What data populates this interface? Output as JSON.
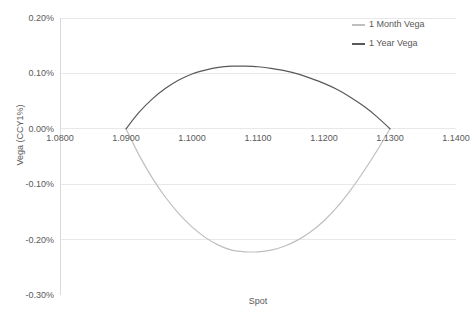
{
  "chart_data": {
    "type": "line",
    "title": "",
    "xlabel": "Spot",
    "ylabel": "Vega (CCY1%)",
    "xlim": [
      1.08,
      1.14
    ],
    "ylim": [
      -0.003,
      0.002
    ],
    "xtick_labels": [
      "1.0800",
      "1.0900",
      "1.1000",
      "1.1100",
      "1.1200",
      "1.1300",
      "1.1400"
    ],
    "xtick_values": [
      1.08,
      1.09,
      1.1,
      1.11,
      1.12,
      1.13,
      1.14
    ],
    "ytick_labels": [
      "0.20%",
      "0.10%",
      "0.00%",
      "-0.10%",
      "-0.20%",
      "-0.30%"
    ],
    "ytick_values": [
      0.002,
      0.001,
      0.0,
      -0.001,
      -0.002,
      -0.003
    ],
    "grid": "horizontal",
    "legend_position": "top-right-inside",
    "series": [
      {
        "name": "1 Month Vega",
        "color": "#BFBFBF",
        "x": [
          1.09,
          1.092,
          1.094,
          1.096,
          1.098,
          1.1,
          1.102,
          1.104,
          1.106,
          1.108,
          1.11,
          1.112,
          1.114,
          1.116,
          1.118,
          1.12,
          1.122,
          1.124,
          1.126,
          1.128,
          1.13
        ],
        "values": [
          0.0,
          -0.00048,
          -0.00089,
          -0.00124,
          -0.00153,
          -0.00177,
          -0.00196,
          -0.0021,
          -0.00219,
          -0.00222,
          -0.00222,
          -0.00219,
          -0.00212,
          -0.00201,
          -0.00186,
          -0.00166,
          -0.00141,
          -0.00111,
          -0.00077,
          -0.0004,
          0.0
        ]
      },
      {
        "name": "1 Year Vega",
        "color": "#595959",
        "x": [
          1.09,
          1.092,
          1.094,
          1.096,
          1.098,
          1.1,
          1.102,
          1.104,
          1.106,
          1.108,
          1.11,
          1.112,
          1.114,
          1.116,
          1.118,
          1.12,
          1.122,
          1.124,
          1.126,
          1.128,
          1.13
        ],
        "values": [
          0.0,
          0.0003,
          0.00054,
          0.00073,
          0.00088,
          0.00099,
          0.00106,
          0.00111,
          0.00113,
          0.00113,
          0.00112,
          0.00109,
          0.00105,
          0.00099,
          0.00091,
          0.00082,
          0.00071,
          0.00057,
          0.00041,
          0.00022,
          0.0
        ]
      }
    ]
  },
  "legend": {
    "items": [
      {
        "label": "1 Month Vega",
        "color": "#BFBFBF"
      },
      {
        "label": "1 Year Vega",
        "color": "#595959"
      }
    ]
  },
  "axes": {
    "x_title": "Spot",
    "y_title": "Vega (CCY1%)"
  },
  "colors": {
    "gridline": "#E8E8E8",
    "axis_line": "#D9D9D9",
    "text": "#595959",
    "background": "#FFFFFF"
  }
}
